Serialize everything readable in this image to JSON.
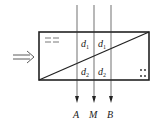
{
  "diagram": {
    "incoming_arrow_icon": "double-line-arrow-right",
    "regions": {
      "upper_left": "d",
      "upper_left_sub": "1",
      "upper_right": "d",
      "upper_right_sub": "1",
      "lower_left": "d",
      "lower_left_sub": "2",
      "lower_right": "d",
      "lower_right_sub": "2"
    },
    "outputs": [
      {
        "label": "A"
      },
      {
        "label": "M"
      },
      {
        "label": "B"
      }
    ],
    "symbols": {
      "upper_left_mark": "dashed-lines",
      "lower_right_mark": "dots"
    },
    "colors": {
      "stroke": "#222222",
      "background": "#ffffff"
    }
  }
}
